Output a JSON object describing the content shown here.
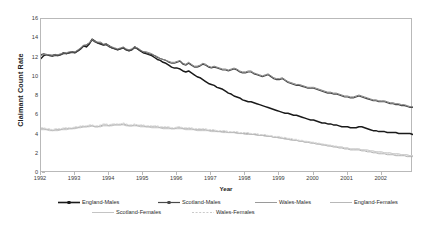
{
  "chart_data": {
    "type": "line",
    "title": "",
    "xlabel": "Year",
    "ylabel": "Claimant Count Rate",
    "xlim": [
      1992.0,
      2002.92
    ],
    "ylim": [
      0,
      16
    ],
    "grid": false,
    "legend_position": "bottom",
    "x_tick_labels": [
      "1992",
      "1993",
      "1994",
      "1995",
      "1996",
      "1997",
      "1998",
      "1999",
      "2000",
      "2001",
      "2002"
    ],
    "x_tick_values": [
      1992,
      1993,
      1994,
      1995,
      1996,
      1997,
      1998,
      1999,
      2000,
      2001,
      2002
    ],
    "y_tick_labels": [
      "0",
      "2",
      "4",
      "6",
      "8",
      "10",
      "12",
      "14",
      "16"
    ],
    "y_tick_values": [
      0,
      2,
      4,
      6,
      8,
      10,
      12,
      14,
      16
    ],
    "x_start": 1992.0,
    "x_step": 0.08333,
    "series": [
      {
        "name": "England-Males",
        "color": "#1a1a1a",
        "width": 1.5,
        "dash": "none",
        "values": [
          11.9,
          12.2,
          12.3,
          12.2,
          12.2,
          12.3,
          12.2,
          12.3,
          12.5,
          12.4,
          12.5,
          12.6,
          12.5,
          12.7,
          12.9,
          13.2,
          13.1,
          13.4,
          13.9,
          13.7,
          13.5,
          13.4,
          13.3,
          13.4,
          13.2,
          13.0,
          12.9,
          12.8,
          12.9,
          13.0,
          12.8,
          12.7,
          12.8,
          13.1,
          12.9,
          12.7,
          12.5,
          12.4,
          12.3,
          12.2,
          12.0,
          11.8,
          11.7,
          11.5,
          11.4,
          11.2,
          11.0,
          10.9,
          10.9,
          10.8,
          10.6,
          10.5,
          10.6,
          10.4,
          10.2,
          10.0,
          9.9,
          9.7,
          9.5,
          9.3,
          9.2,
          9.1,
          8.9,
          8.8,
          8.7,
          8.5,
          8.3,
          8.2,
          8.0,
          7.9,
          7.8,
          7.6,
          7.5,
          7.4,
          7.4,
          7.3,
          7.2,
          7.1,
          7.0,
          6.9,
          6.8,
          6.7,
          6.6,
          6.5,
          6.4,
          6.3,
          6.2,
          6.2,
          6.1,
          6.0,
          6.0,
          5.9,
          5.8,
          5.7,
          5.6,
          5.5,
          5.5,
          5.4,
          5.3,
          5.2,
          5.2,
          5.1,
          5.1,
          5.0,
          5.0,
          4.9,
          4.8,
          4.8,
          4.8,
          4.7,
          4.7,
          4.7,
          4.8,
          4.8,
          4.7,
          4.6,
          4.5,
          4.4,
          4.4,
          4.3,
          4.3,
          4.3,
          4.2,
          4.2,
          4.2,
          4.2,
          4.1,
          4.1,
          4.1,
          4.1,
          4.1,
          4.0,
          4.0
        ]
      },
      {
        "name": "Scotland-Males",
        "color": "#4a4a4a",
        "width": 1.1,
        "dash": "none",
        "values": [
          12.3,
          12.4,
          12.3,
          12.2,
          12.1,
          12.2,
          12.2,
          12.3,
          12.4,
          12.4,
          12.5,
          12.5,
          12.5,
          12.7,
          12.9,
          13.2,
          13.3,
          13.5,
          13.8,
          13.6,
          13.5,
          13.5,
          13.3,
          13.3,
          13.1,
          13.0,
          12.9,
          12.8,
          12.9,
          13.0,
          12.8,
          12.7,
          12.8,
          13.0,
          12.9,
          12.7,
          12.6,
          12.5,
          12.4,
          12.3,
          12.2,
          12.0,
          11.9,
          11.8,
          11.7,
          11.5,
          11.4,
          11.4,
          11.5,
          11.6,
          11.3,
          11.2,
          11.4,
          11.2,
          11.0,
          11.0,
          11.1,
          11.3,
          11.2,
          11.0,
          10.9,
          11.0,
          10.9,
          10.8,
          10.7,
          10.7,
          10.6,
          10.7,
          10.8,
          10.7,
          10.5,
          10.4,
          10.4,
          10.5,
          10.5,
          10.3,
          10.2,
          10.1,
          10.0,
          10.1,
          10.2,
          10.0,
          9.8,
          9.7,
          9.7,
          9.8,
          9.6,
          9.4,
          9.3,
          9.2,
          9.1,
          9.1,
          9.0,
          8.9,
          8.8,
          8.8,
          8.8,
          8.7,
          8.6,
          8.5,
          8.4,
          8.3,
          8.3,
          8.2,
          8.2,
          8.1,
          8.0,
          7.9,
          7.9,
          7.8,
          7.8,
          7.9,
          8.0,
          7.9,
          7.8,
          7.7,
          7.6,
          7.5,
          7.5,
          7.4,
          7.4,
          7.4,
          7.3,
          7.2,
          7.2,
          7.1,
          7.1,
          7.0,
          7.0,
          6.9,
          6.8,
          6.8,
          6.7
        ]
      },
      {
        "name": "Wales-Males",
        "color": "#808080",
        "width": 1.0,
        "dash": "none",
        "values": [
          12.2,
          12.3,
          12.3,
          12.3,
          12.2,
          12.3,
          12.3,
          12.4,
          12.5,
          12.5,
          12.6,
          12.6,
          12.6,
          12.8,
          13.0,
          13.3,
          13.3,
          13.5,
          13.9,
          13.7,
          13.6,
          13.6,
          13.4,
          13.4,
          13.2,
          13.1,
          13.0,
          12.9,
          13.0,
          13.1,
          12.9,
          12.8,
          12.9,
          13.1,
          13.0,
          12.8,
          12.6,
          12.6,
          12.5,
          12.4,
          12.2,
          12.1,
          11.9,
          11.8,
          11.7,
          11.6,
          11.5,
          11.5,
          11.6,
          11.7,
          11.4,
          11.3,
          11.5,
          11.3,
          11.1,
          11.1,
          11.2,
          11.4,
          11.3,
          11.1,
          11.0,
          11.1,
          11.0,
          10.9,
          10.8,
          10.8,
          10.7,
          10.8,
          10.9,
          10.8,
          10.6,
          10.5,
          10.5,
          10.6,
          10.6,
          10.4,
          10.3,
          10.2,
          10.1,
          10.2,
          10.3,
          10.1,
          9.9,
          9.8,
          9.8,
          9.9,
          9.7,
          9.5,
          9.4,
          9.3,
          9.2,
          9.2,
          9.1,
          9.0,
          8.9,
          8.9,
          8.9,
          8.8,
          8.7,
          8.6,
          8.5,
          8.4,
          8.4,
          8.3,
          8.3,
          8.2,
          8.1,
          8.0,
          8.0,
          7.9,
          7.9,
          8.0,
          8.1,
          8.0,
          7.9,
          7.8,
          7.7,
          7.6,
          7.6,
          7.5,
          7.5,
          7.5,
          7.4,
          7.3,
          7.3,
          7.2,
          7.2,
          7.1,
          7.1,
          7.0,
          6.9,
          6.9,
          6.8
        ]
      },
      {
        "name": "England-Females",
        "color": "#a8a8a8",
        "width": 0.9,
        "dash": "none",
        "values": [
          4.6,
          4.6,
          4.5,
          4.5,
          4.4,
          4.5,
          4.5,
          4.5,
          4.6,
          4.6,
          4.6,
          4.6,
          4.7,
          4.7,
          4.8,
          4.8,
          4.8,
          4.9,
          4.9,
          4.8,
          4.8,
          4.9,
          5.0,
          5.0,
          4.9,
          5.0,
          5.0,
          5.0,
          5.0,
          5.1,
          5.0,
          4.9,
          4.9,
          5.0,
          4.9,
          4.9,
          4.9,
          4.8,
          4.8,
          4.8,
          4.8,
          4.8,
          4.7,
          4.7,
          4.7,
          4.7,
          4.6,
          4.6,
          4.7,
          4.7,
          4.6,
          4.6,
          4.6,
          4.6,
          4.5,
          4.5,
          4.5,
          4.5,
          4.5,
          4.4,
          4.4,
          4.4,
          4.3,
          4.3,
          4.3,
          4.3,
          4.2,
          4.2,
          4.2,
          4.2,
          4.1,
          4.1,
          4.1,
          4.1,
          4.0,
          4.0,
          4.0,
          3.9,
          3.9,
          3.9,
          3.8,
          3.8,
          3.7,
          3.7,
          3.7,
          3.6,
          3.6,
          3.5,
          3.5,
          3.4,
          3.4,
          3.3,
          3.3,
          3.2,
          3.2,
          3.1,
          3.1,
          3.0,
          3.0,
          2.9,
          2.9,
          2.8,
          2.8,
          2.7,
          2.7,
          2.6,
          2.6,
          2.5,
          2.5,
          2.4,
          2.4,
          2.4,
          2.4,
          2.3,
          2.3,
          2.2,
          2.2,
          2.1,
          2.1,
          2.0,
          2.0,
          2.0,
          1.9,
          1.9,
          1.9,
          1.8,
          1.8,
          1.8,
          1.8,
          1.7,
          1.7,
          1.7,
          1.6
        ]
      },
      {
        "name": "Scotland-Females",
        "color": "#bdbdbd",
        "width": 0.9,
        "dash": "none",
        "values": [
          4.5,
          4.5,
          4.5,
          4.4,
          4.4,
          4.4,
          4.4,
          4.5,
          4.5,
          4.5,
          4.6,
          4.6,
          4.6,
          4.7,
          4.7,
          4.8,
          4.8,
          4.8,
          4.9,
          4.8,
          4.8,
          4.8,
          4.9,
          4.9,
          4.9,
          4.9,
          5.0,
          5.0,
          5.0,
          5.0,
          4.9,
          4.9,
          4.9,
          4.9,
          4.9,
          4.8,
          4.8,
          4.8,
          4.8,
          4.7,
          4.7,
          4.7,
          4.7,
          4.6,
          4.6,
          4.6,
          4.6,
          4.6,
          4.6,
          4.6,
          4.6,
          4.5,
          4.5,
          4.5,
          4.5,
          4.4,
          4.4,
          4.4,
          4.4,
          4.4,
          4.3,
          4.3,
          4.3,
          4.3,
          4.2,
          4.2,
          4.2,
          4.2,
          4.2,
          4.1,
          4.1,
          4.1,
          4.0,
          4.0,
          4.0,
          4.0,
          3.9,
          3.9,
          3.9,
          3.8,
          3.8,
          3.8,
          3.7,
          3.7,
          3.6,
          3.6,
          3.5,
          3.5,
          3.4,
          3.4,
          3.4,
          3.3,
          3.3,
          3.2,
          3.2,
          3.2,
          3.1,
          3.1,
          3.0,
          3.0,
          2.9,
          2.9,
          2.8,
          2.8,
          2.7,
          2.7,
          2.7,
          2.6,
          2.6,
          2.5,
          2.5,
          2.5,
          2.5,
          2.4,
          2.4,
          2.4,
          2.3,
          2.3,
          2.2,
          2.2,
          2.2,
          2.1,
          2.1,
          2.1,
          2.0,
          2.0,
          2.0,
          1.9,
          1.9,
          1.9,
          1.8,
          1.8,
          1.8
        ]
      },
      {
        "name": "Wales-Females",
        "color": "#cfcfcf",
        "width": 0.9,
        "dash": "2,1.5",
        "values": [
          4.7,
          4.7,
          4.6,
          4.6,
          4.5,
          4.6,
          4.6,
          4.6,
          4.7,
          4.7,
          4.7,
          4.7,
          4.8,
          4.8,
          4.9,
          4.9,
          4.9,
          5.0,
          5.0,
          4.9,
          4.9,
          5.0,
          5.1,
          5.1,
          5.0,
          5.1,
          5.1,
          5.1,
          5.1,
          5.2,
          5.1,
          5.0,
          5.0,
          5.1,
          5.0,
          5.0,
          5.0,
          4.9,
          4.9,
          4.9,
          4.9,
          4.9,
          4.8,
          4.8,
          4.8,
          4.8,
          4.7,
          4.7,
          4.8,
          4.8,
          4.7,
          4.7,
          4.7,
          4.7,
          4.6,
          4.6,
          4.6,
          4.6,
          4.6,
          4.5,
          4.5,
          4.5,
          4.4,
          4.4,
          4.4,
          4.4,
          4.3,
          4.3,
          4.3,
          4.3,
          4.2,
          4.2,
          4.2,
          4.2,
          4.1,
          4.1,
          4.1,
          4.0,
          4.0,
          4.0,
          3.9,
          3.9,
          3.8,
          3.8,
          3.8,
          3.7,
          3.7,
          3.6,
          3.6,
          3.5,
          3.5,
          3.4,
          3.4,
          3.3,
          3.3,
          3.2,
          3.2,
          3.1,
          3.1,
          3.0,
          3.0,
          2.9,
          2.9,
          2.8,
          2.8,
          2.7,
          2.7,
          2.6,
          2.6,
          2.5,
          2.5,
          2.5,
          2.5,
          2.4,
          2.4,
          2.3,
          2.3,
          2.2,
          2.2,
          2.1,
          2.1,
          2.1,
          2.0,
          2.0,
          2.0,
          1.9,
          1.9,
          1.9,
          1.9,
          1.8,
          1.8,
          1.8,
          1.7
        ]
      }
    ]
  },
  "legend": {
    "items": [
      {
        "label": "England-Males",
        "color": "#1a1a1a",
        "width": 1.6,
        "dash": "none",
        "marker": "square"
      },
      {
        "label": "Scotland-Males",
        "color": "#4a4a4a",
        "width": 1.2,
        "dash": "none",
        "marker": "square"
      },
      {
        "label": "Wales-Males",
        "color": "#9a9a9a",
        "width": 1.0,
        "dash": "none",
        "marker": "none"
      },
      {
        "label": "England-Females",
        "color": "#b0b0b0",
        "width": 0.9,
        "dash": "none",
        "marker": "none"
      },
      {
        "label": "Scotland-Females",
        "color": "#bdbdbd",
        "width": 0.9,
        "dash": "none",
        "marker": "none"
      },
      {
        "label": "Wales-Females",
        "color": "#c4c4c4",
        "width": 0.9,
        "dash": "2,1.6",
        "marker": "none"
      }
    ]
  }
}
